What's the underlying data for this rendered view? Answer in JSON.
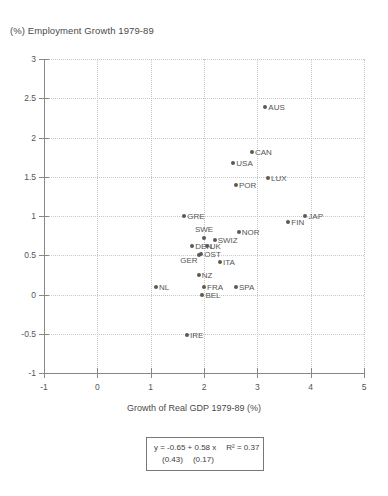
{
  "chart_data": {
    "type": "scatter",
    "title": "(%) Employment Growth 1979-89",
    "xlabel": "Growth of Real GDP 1979-89 (%)",
    "ylabel": "(%) Employment Growth 1979-89",
    "xlim": [
      -1,
      5
    ],
    "ylim": [
      -1,
      3
    ],
    "xticks": [
      "-1",
      "0",
      "1",
      "2",
      "3",
      "4",
      "5"
    ],
    "yticks": [
      "3",
      "2.5",
      "2",
      "1.5",
      "1",
      "0.5",
      "0",
      "-0.5",
      "-1"
    ],
    "xtick_values": [
      -1,
      0,
      1,
      2,
      3,
      4,
      5
    ],
    "ytick_values": [
      3,
      2.5,
      2,
      1.5,
      1,
      0.5,
      0,
      -0.5,
      -1
    ],
    "grid": true,
    "legend": "none",
    "marker_color": "#595959",
    "points": [
      {
        "label": "AUS",
        "x": 3.15,
        "y": 2.39,
        "pos": "right"
      },
      {
        "label": "CAN",
        "x": 2.9,
        "y": 1.82,
        "pos": "right"
      },
      {
        "label": "USA",
        "x": 2.55,
        "y": 1.67,
        "pos": "right"
      },
      {
        "label": "LUX",
        "x": 3.2,
        "y": 1.48,
        "pos": "right"
      },
      {
        "label": "POR",
        "x": 2.6,
        "y": 1.39,
        "pos": "right"
      },
      {
        "label": "GRE",
        "x": 1.63,
        "y": 1.0,
        "pos": "right"
      },
      {
        "label": "JAP",
        "x": 3.9,
        "y": 1.0,
        "pos": "right"
      },
      {
        "label": "FIN",
        "x": 3.58,
        "y": 0.92,
        "pos": "right"
      },
      {
        "label": "NOR",
        "x": 2.65,
        "y": 0.8,
        "pos": "right"
      },
      {
        "label": "SWE",
        "x": 2.0,
        "y": 0.72,
        "pos": "above"
      },
      {
        "label": "SWIZ",
        "x": 2.2,
        "y": 0.69,
        "pos": "right"
      },
      {
        "label": "DEN",
        "x": 1.78,
        "y": 0.62,
        "pos": "right"
      },
      {
        "label": "UK",
        "x": 2.05,
        "y": 0.62,
        "pos": "right"
      },
      {
        "label": "OST",
        "x": 1.95,
        "y": 0.52,
        "pos": "right"
      },
      {
        "label": "GER",
        "x": 1.9,
        "y": 0.5,
        "pos": "below-left"
      },
      {
        "label": "ITA",
        "x": 2.3,
        "y": 0.41,
        "pos": "right"
      },
      {
        "label": "NZ",
        "x": 1.9,
        "y": 0.25,
        "pos": "right"
      },
      {
        "label": "NL",
        "x": 1.1,
        "y": 0.1,
        "pos": "right"
      },
      {
        "label": "FRA",
        "x": 2.0,
        "y": 0.1,
        "pos": "right"
      },
      {
        "label": "SPA",
        "x": 2.6,
        "y": 0.1,
        "pos": "right"
      },
      {
        "label": "BEL",
        "x": 1.97,
        "y": 0.0,
        "pos": "right"
      },
      {
        "label": "IRE",
        "x": 1.68,
        "y": -0.52,
        "pos": "right"
      }
    ],
    "annotation": {
      "equation": "y = -0.65 + 0.58 x",
      "r_squared": "R² = 0.37",
      "se_intercept": "(0.43)",
      "se_slope": "(0.17)"
    }
  }
}
